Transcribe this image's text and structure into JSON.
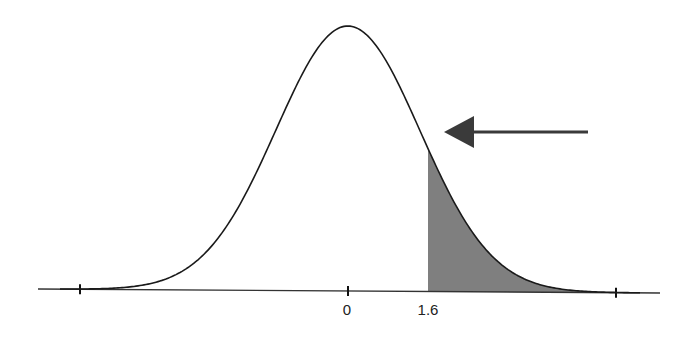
{
  "diagram": {
    "type": "normal-distribution",
    "mean_label": "0",
    "cutoff_label": "1.6",
    "shaded_region": "right tail beyond 1.6",
    "colors": {
      "curve": "#1a1a1a",
      "axis": "#333333",
      "shade": "#7f7f7f",
      "arrow": "#3a3a3a"
    },
    "geometry": {
      "axis_x_start": 38,
      "axis_x_end": 660,
      "axis_y_left": 289,
      "axis_y_right": 293,
      "mean_x": 348,
      "peak_y": 26,
      "sigma_px": 72,
      "cutoff_x": 428,
      "ticks_x": [
        80,
        348,
        616
      ],
      "arrow": {
        "x_tail": 588,
        "x_tip": 444,
        "y": 132,
        "head_length": 30,
        "head_half_height": 16
      }
    },
    "labels": [
      {
        "text": "0",
        "x": 347,
        "y": 313
      },
      {
        "text": "1.6",
        "x": 428,
        "y": 313
      }
    ]
  }
}
